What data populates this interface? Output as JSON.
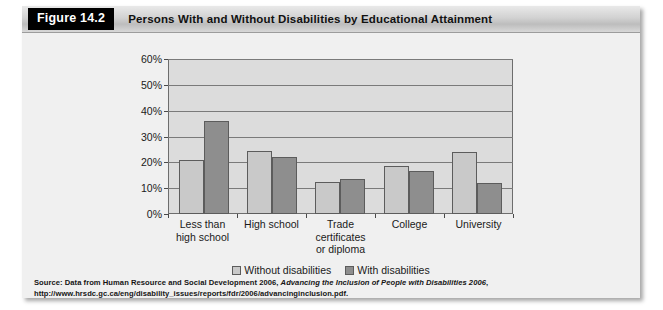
{
  "figure": {
    "number_label": "Figure 14.2",
    "title": "Persons With and Without Disabilities by Educational Attainment"
  },
  "source": {
    "prefix": "Source: Data from Human Resource and Social Development 2006, ",
    "italic_title": "Advancing the Inclusion of People with Disabilities 2006",
    "suffix": ", http://www.hrsdc.gc.ca/eng/disability_issues/reports/fdr/2006/advancinginclusion.pdf."
  },
  "chart_data": {
    "type": "bar",
    "title": "Persons With and Without Disabilities by Educational Attainment",
    "xlabel": "",
    "ylabel": "",
    "ylim": [
      0,
      60
    ],
    "yticks": [
      "0%",
      "10%",
      "20%",
      "30%",
      "40%",
      "50%",
      "60%"
    ],
    "ytick_values": [
      0,
      10,
      20,
      30,
      40,
      50,
      60
    ],
    "grid": true,
    "legend_position": "bottom-center",
    "categories": [
      "Less than\nhigh school",
      "High school",
      "Trade\ncertificates\nor diploma",
      "College",
      "University"
    ],
    "category_labels": [
      [
        "Less than",
        "high school"
      ],
      [
        "High school"
      ],
      [
        "Trade",
        "certificates",
        "or diploma"
      ],
      [
        "College"
      ],
      [
        "University"
      ]
    ],
    "series": [
      {
        "name": "Without disabilities",
        "color": "#c9c9c9",
        "values": [
          21,
          24.5,
          12.5,
          18.5,
          24
        ]
      },
      {
        "name": "With disabilities",
        "color": "#8e8e8e",
        "values": [
          36,
          22,
          13.5,
          16.5,
          12
        ]
      }
    ]
  },
  "colors": {
    "plot_background": "#dcdcdc",
    "panel_background": "#f0f0f0",
    "gridline": "#7a7a7a",
    "axis": "#6d6d6d",
    "bar_without": "#c9c9c9",
    "bar_with": "#8e8e8e",
    "header_badge_bg": "#000000",
    "header_badge_fg": "#ffffff"
  }
}
